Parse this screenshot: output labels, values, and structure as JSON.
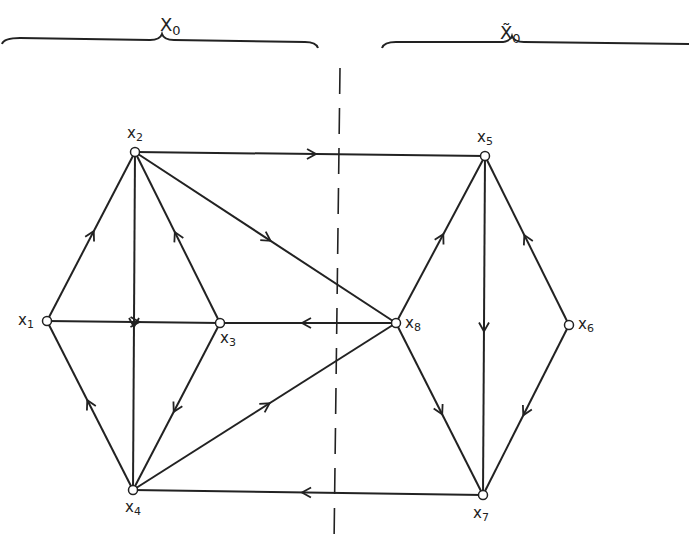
{
  "sets": [
    {
      "id": "X0",
      "name": "X",
      "subscript": "0",
      "tilde": false,
      "x": 160,
      "y": 14
    },
    {
      "id": "X0tilde",
      "name": "X",
      "subscript": "0",
      "tilde": true,
      "x": 500,
      "y": 22
    }
  ],
  "nodes": [
    {
      "id": "x1",
      "name": "x",
      "sub": "1",
      "x": 47,
      "y": 321,
      "lx": 18,
      "ly": 313
    },
    {
      "id": "x2",
      "name": "x",
      "sub": "2",
      "x": 135,
      "y": 152,
      "lx": 127,
      "ly": 126
    },
    {
      "id": "x3",
      "name": "x",
      "sub": "3",
      "x": 220,
      "y": 323,
      "lx": 220,
      "ly": 331
    },
    {
      "id": "x4",
      "name": "x",
      "sub": "4",
      "x": 133,
      "y": 490,
      "lx": 125,
      "ly": 500
    },
    {
      "id": "x5",
      "name": "x",
      "sub": "5",
      "x": 485,
      "y": 156,
      "lx": 477,
      "ly": 130
    },
    {
      "id": "x6",
      "name": "x",
      "sub": "6",
      "x": 569,
      "y": 325,
      "lx": 578,
      "ly": 317
    },
    {
      "id": "x7",
      "name": "x",
      "sub": "7",
      "x": 483,
      "y": 495,
      "lx": 473,
      "ly": 506
    },
    {
      "id": "x8",
      "name": "x",
      "sub": "8",
      "x": 396,
      "y": 323,
      "lx": 405,
      "ly": 316
    }
  ],
  "edges": [
    {
      "from": "x1",
      "to": "x2"
    },
    {
      "from": "x1",
      "to": "x3"
    },
    {
      "from": "x4",
      "to": "x1"
    },
    {
      "from": "x2",
      "to": "x4"
    },
    {
      "from": "x3",
      "to": "x2"
    },
    {
      "from": "x2",
      "to": "x5"
    },
    {
      "from": "x2",
      "to": "x8"
    },
    {
      "from": "x8",
      "to": "x3"
    },
    {
      "from": "x3",
      "to": "x4"
    },
    {
      "from": "x4",
      "to": "x8"
    },
    {
      "from": "x7",
      "to": "x4"
    },
    {
      "from": "x8",
      "to": "x5"
    },
    {
      "from": "x5",
      "to": "x7"
    },
    {
      "from": "x6",
      "to": "x5"
    },
    {
      "from": "x6",
      "to": "x7"
    },
    {
      "from": "x8",
      "to": "x7"
    }
  ],
  "divider": {
    "x": 340,
    "y1": 68,
    "y2": 545
  }
}
